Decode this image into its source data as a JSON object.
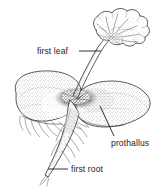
{
  "figure": {
    "style": "stippled pen-and-ink botanical line drawing",
    "background_color": "#ffffff",
    "ink_color": "#262626",
    "text_color": "#1d1d1d",
    "width": 165,
    "height": 190
  },
  "labels": [
    {
      "id": "first-leaf",
      "text": "first leaf",
      "text_x": 37,
      "text_y": 54,
      "anchor": "start",
      "leader": {
        "x1": 79,
        "y1": 51,
        "x2": 101,
        "y2": 51
      }
    },
    {
      "id": "prothallus",
      "text": "prothallus",
      "text_x": 111,
      "text_y": 146,
      "anchor": "start",
      "leader": {
        "x1": 114,
        "y1": 136,
        "x2": 100,
        "y2": 106
      }
    },
    {
      "id": "first-root",
      "text": "first root",
      "text_x": 71,
      "text_y": 172,
      "anchor": "start",
      "leader": {
        "x1": 48,
        "y1": 169,
        "x2": 68,
        "y2": 169
      }
    }
  ],
  "parts": {
    "leaf": "first leaf — scalloped fan-shaped lamina with radiating veins",
    "petiole": "slender stalk joining leaf to prothallus",
    "prothallus": "heart-shaped stippled gametophyte thallus",
    "root": "first root tapering downward with fine root hairs",
    "rhizoids": "fine hairs on underside of prothallus"
  }
}
